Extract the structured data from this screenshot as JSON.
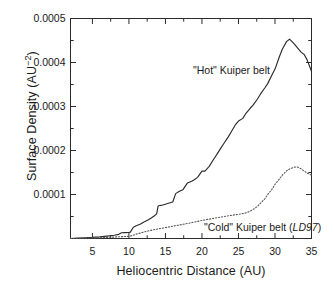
{
  "chart_data": {
    "type": "line",
    "title": "",
    "xlabel": "Heliocentric Distance (AU)",
    "ylabel_text": "Surface Density (AU",
    "ylabel_exponent": "−2",
    "ylabel_close": ")",
    "ylabel_full": "Surface Density (AU−2)",
    "xlim": [
      2.0,
      35.0
    ],
    "ylim": [
      0,
      0.0005
    ],
    "grid": false,
    "legend_position": "inline-annotations",
    "xticks": [
      5,
      10,
      15,
      20,
      25,
      30,
      35
    ],
    "xtick_labels": [
      "5",
      "10",
      "15",
      "20",
      "25",
      "30",
      "35"
    ],
    "xminor_ticks": [
      7.5,
      12.5,
      17.5,
      22.5,
      27.5,
      32.5
    ],
    "yticks": [
      0.0001,
      0.0002,
      0.0003,
      0.0004,
      0.0005
    ],
    "ytick_labels": [
      "0.0001",
      "0.0002",
      "0.0003",
      "0.0004",
      "0.0005"
    ],
    "yminor_ticks": [
      5e-05,
      0.00015,
      0.00025,
      0.00035,
      0.00045
    ],
    "series": [
      {
        "name": "\"Hot\" Kuiper belt",
        "style": "solid",
        "color": "#2b2b2b",
        "annotation": "\"Hot\" Kuiper belt",
        "x": [
          2.0,
          3.0,
          4.0,
          5.0,
          6.0,
          7.0,
          8.0,
          8.6,
          9.0,
          9.4,
          10.0,
          10.2,
          10.6,
          11.0,
          11.6,
          12.0,
          12.6,
          13.0,
          13.4,
          13.8,
          14.0,
          14.2,
          14.6,
          15.0,
          15.4,
          16.0,
          16.4,
          16.8,
          17.0,
          17.4,
          18.0,
          18.6,
          19.0,
          19.4,
          20.0,
          20.4,
          21.0,
          21.6,
          22.0,
          22.6,
          23.0,
          23.6,
          24.0,
          24.6,
          25.0,
          25.6,
          26.0,
          26.6,
          27.0,
          27.6,
          28.0,
          28.6,
          29.0,
          29.6,
          30.0,
          30.6,
          31.0,
          31.6,
          32.0,
          32.6,
          33.0,
          33.6,
          34.0,
          34.4,
          35.0
        ],
        "y": [
          0.0,
          8e-07,
          1.6e-06,
          2.5e-06,
          3.8e-06,
          5.5e-06,
          7.5e-06,
          9.5e-06,
          1.3e-05,
          1.35e-05,
          1.4e-05,
          1.45e-05,
          2.55e-05,
          2.9e-05,
          3.3e-05,
          3.7e-05,
          4.2e-05,
          4.6e-05,
          5.05e-05,
          5.6e-05,
          7.4e-05,
          7.5e-05,
          7.6e-05,
          7.8e-05,
          8e-05,
          8.3e-05,
          0.000102,
          0.000106,
          0.000108,
          0.000111,
          0.000126,
          0.00013,
          0.000134,
          0.000139,
          0.000153,
          0.000153,
          0.000164,
          0.00018,
          0.00019,
          0.000206,
          0.000216,
          0.000231,
          0.000242,
          0.000259,
          0.000267,
          0.000273,
          0.000284,
          0.000296,
          0.000303,
          0.000317,
          0.000328,
          0.000342,
          0.000352,
          0.000372,
          0.000385,
          0.000413,
          0.00043,
          0.000448,
          0.000453,
          0.000443,
          0.000435,
          0.000423,
          0.000418,
          0.000406,
          0.00038
        ]
      },
      {
        "name": "\"Cold\" Kuiper belt (LD97)",
        "style": "dotted",
        "color": "#5a5a5a",
        "annotation_prefix": "\"Cold\" Kuiper belt (",
        "annotation_italic": "LD97",
        "annotation_suffix": ")",
        "x": [
          2.0,
          4.0,
          6.0,
          7.0,
          8.0,
          9.0,
          10.0,
          10.6,
          11.0,
          11.6,
          12.0,
          12.6,
          13.0,
          13.6,
          14.0,
          14.6,
          15.0,
          15.6,
          16.0,
          17.0,
          18.0,
          19.0,
          20.0,
          21.0,
          22.0,
          23.0,
          24.0,
          25.0,
          26.0,
          26.6,
          27.0,
          27.6,
          28.0,
          28.6,
          29.0,
          29.6,
          30.0,
          30.6,
          31.0,
          31.6,
          32.0,
          32.6,
          33.0,
          33.6,
          34.0,
          34.4,
          35.0
        ],
        "y": [
          0.0,
          8e-07,
          1.8e-06,
          2.5e-06,
          3.3e-06,
          4.2e-06,
          5e-06,
          7.5e-06,
          1e-05,
          1.25e-05,
          1.45e-05,
          1.7e-05,
          1.85e-05,
          2.05e-05,
          2.2e-05,
          2.35e-05,
          2.5e-05,
          2.65e-05,
          2.8e-05,
          3.1e-05,
          3.4e-05,
          3.75e-05,
          4.1e-05,
          4.4e-05,
          4.7e-05,
          5e-05,
          5.25e-05,
          5.5e-05,
          5.8e-05,
          6.2e-05,
          6.6e-05,
          7.3e-05,
          8e-05,
          9e-05,
          0.0001,
          0.000112,
          0.000123,
          0.000135,
          0.000144,
          0.000154,
          0.000158,
          0.000162,
          0.000163,
          0.000158,
          0.000153,
          0.000149,
          0.000144
        ]
      }
    ],
    "annotations": [
      {
        "id": "hot-label",
        "text": "\"Hot\" Kuiper belt",
        "x_px": 193,
        "y_px": 64
      },
      {
        "id": "cold-label",
        "text": "\"Cold\" Kuiper belt (LD97)",
        "x_px": 204,
        "y_px": 221
      }
    ],
    "axis_color": "#2b2b2b",
    "background": "#ffffff"
  }
}
